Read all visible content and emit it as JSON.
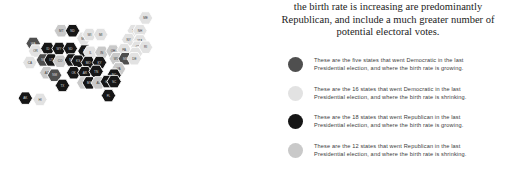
{
  "headline": {
    "lines": [
      "the birth rate is increasing are predominantly",
      "Republican, and include a much greater number of",
      "potential electoral votes."
    ]
  },
  "colors": {
    "dem_growing": "#4f4f4f",
    "dem_shrinking": "#e2e2e2",
    "rep_growing": "#161616",
    "rep_shrinking": "#c9c9c9",
    "background": "#ffffff",
    "hex_border": "#ffffff",
    "label_dark": "#3b3b3b",
    "label_light": "#d8d8d8",
    "headline_text": "#1c1c1c",
    "legend_text": "#3b3b3b"
  },
  "legend": {
    "items": [
      {
        "swatch": "dem_growing",
        "line1": "These are the five states that went Democratic in the last",
        "line2": "Presidential election, and where the birth rate is growing."
      },
      {
        "swatch": "dem_shrinking",
        "line1": "These are the 16 states that went Democratic in the last",
        "line2": "Presidential election, and where the birth rate is shrinking."
      },
      {
        "swatch": "rep_growing",
        "line1": "These are the 18 states that went Republican in the last",
        "line2": "Presidential election, and where the birth rate is growing."
      },
      {
        "swatch": "rep_shrinking",
        "line1": "These are the 12 states that went Republican in the last",
        "line2": "Presidential election, and where the birth rate is shrinking."
      }
    ]
  },
  "chart_data": {
    "type": "map",
    "subtype": "hex-tile-cartogram",
    "title": "",
    "legend_position": "right",
    "categories": [
      "dem_growing",
      "dem_shrinking",
      "rep_growing",
      "rep_shrinking"
    ],
    "category_counts": {
      "dem_growing": 5,
      "dem_shrinking": 16,
      "rep_growing": 18,
      "rep_shrinking": 12
    },
    "states": [
      {
        "code": "ME",
        "col": 11,
        "row": 0,
        "cat": "dem_shrinking"
      },
      {
        "code": "VT",
        "col": 10,
        "row": 1,
        "cat": "dem_shrinking"
      },
      {
        "code": "NH",
        "col": 10.5,
        "row": 1,
        "cat": "dem_shrinking"
      },
      {
        "code": "WA",
        "col": 1,
        "row": 2,
        "cat": "dem_growing"
      },
      {
        "code": "MT",
        "col": 3.5,
        "row": 1,
        "cat": "rep_shrinking"
      },
      {
        "code": "ND",
        "col": 4.5,
        "row": 1,
        "cat": "rep_growing"
      },
      {
        "code": "MN",
        "col": 5.5,
        "row": 1.6,
        "cat": "dem_shrinking"
      },
      {
        "code": "WI",
        "col": 6,
        "row": 1.3,
        "cat": "dem_shrinking"
      },
      {
        "code": "MI",
        "col": 7,
        "row": 1.3,
        "cat": "dem_shrinking"
      },
      {
        "code": "NY",
        "col": 9.5,
        "row": 1.7,
        "cat": "dem_shrinking"
      },
      {
        "code": "MA",
        "col": 10.5,
        "row": 1.8,
        "cat": "dem_shrinking"
      },
      {
        "code": "CT",
        "col": 10.3,
        "row": 2.3,
        "cat": "dem_shrinking"
      },
      {
        "code": "RI",
        "col": 11,
        "row": 2.3,
        "cat": "dem_shrinking"
      },
      {
        "code": "OR",
        "col": 1.2,
        "row": 2.6,
        "cat": "dem_shrinking"
      },
      {
        "code": "ID",
        "col": 2.3,
        "row": 2.4,
        "cat": "rep_growing"
      },
      {
        "code": "WY",
        "col": 3.3,
        "row": 2.4,
        "cat": "rep_growing"
      },
      {
        "code": "SD",
        "col": 4.3,
        "row": 2.4,
        "cat": "rep_growing"
      },
      {
        "code": "IA",
        "col": 5.6,
        "row": 2.6,
        "cat": "rep_growing"
      },
      {
        "code": "IL",
        "col": 6.1,
        "row": 2.7,
        "cat": "dem_shrinking"
      },
      {
        "code": "IN",
        "col": 7.1,
        "row": 2.7,
        "cat": "rep_shrinking"
      },
      {
        "code": "OH",
        "col": 8.1,
        "row": 2.6,
        "cat": "rep_shrinking"
      },
      {
        "code": "PA",
        "col": 9.1,
        "row": 2.5,
        "cat": "dem_shrinking"
      },
      {
        "code": "NJ",
        "col": 10.1,
        "row": 2.8,
        "cat": "dem_shrinking"
      },
      {
        "code": "CA",
        "col": 0.7,
        "row": 3.5,
        "cat": "dem_shrinking"
      },
      {
        "code": "NV",
        "col": 1.9,
        "row": 3.3,
        "cat": "dem_growing"
      },
      {
        "code": "UT",
        "col": 2.6,
        "row": 3.3,
        "cat": "rep_growing"
      },
      {
        "code": "CO",
        "col": 3.4,
        "row": 3.4,
        "cat": "rep_shrinking"
      },
      {
        "code": "NE",
        "col": 4.4,
        "row": 3.3,
        "cat": "rep_growing"
      },
      {
        "code": "KS",
        "col": 5,
        "row": 3.4,
        "cat": "rep_growing"
      },
      {
        "code": "MO",
        "col": 5.9,
        "row": 3.5,
        "cat": "rep_growing"
      },
      {
        "code": "KY",
        "col": 6.9,
        "row": 3.5,
        "cat": "rep_growing"
      },
      {
        "code": "WV",
        "col": 8.4,
        "row": 3.2,
        "cat": "rep_shrinking"
      },
      {
        "code": "MD",
        "col": 9.2,
        "row": 3.2,
        "cat": "dem_growing"
      },
      {
        "code": "DE",
        "col": 10,
        "row": 3.2,
        "cat": "dem_shrinking"
      },
      {
        "code": "AZ",
        "col": 2.2,
        "row": 4.3,
        "cat": "rep_shrinking"
      },
      {
        "code": "NM",
        "col": 2.9,
        "row": 4.5,
        "cat": "dem_growing"
      },
      {
        "code": "OK",
        "col": 4.6,
        "row": 4.3,
        "cat": "rep_growing"
      },
      {
        "code": "AR",
        "col": 5.6,
        "row": 4.3,
        "cat": "rep_growing"
      },
      {
        "code": "TN",
        "col": 6.6,
        "row": 4.2,
        "cat": "rep_growing"
      },
      {
        "code": "VA",
        "col": 8.6,
        "row": 4,
        "cat": "rep_shrinking"
      },
      {
        "code": "NC",
        "col": 8.2,
        "row": 4.5,
        "cat": "rep_growing"
      },
      {
        "code": "TX",
        "col": 3.6,
        "row": 5.3,
        "cat": "rep_growing"
      },
      {
        "code": "LA",
        "col": 5.5,
        "row": 5.1,
        "cat": "rep_shrinking"
      },
      {
        "code": "MS",
        "col": 6,
        "row": 5.1,
        "cat": "rep_growing"
      },
      {
        "code": "AL",
        "col": 6.8,
        "row": 5.1,
        "cat": "rep_shrinking"
      },
      {
        "code": "GA",
        "col": 7.6,
        "row": 5,
        "cat": "rep_growing"
      },
      {
        "code": "SC",
        "col": 8.2,
        "row": 5,
        "cat": "rep_growing"
      },
      {
        "code": "FL",
        "col": 7.7,
        "row": 6.1,
        "cat": "rep_growing"
      },
      {
        "code": "AK",
        "col": 0.3,
        "row": 6.3,
        "cat": "rep_growing"
      },
      {
        "code": "HI",
        "col": 1.6,
        "row": 6.4,
        "cat": "dem_shrinking"
      }
    ]
  }
}
